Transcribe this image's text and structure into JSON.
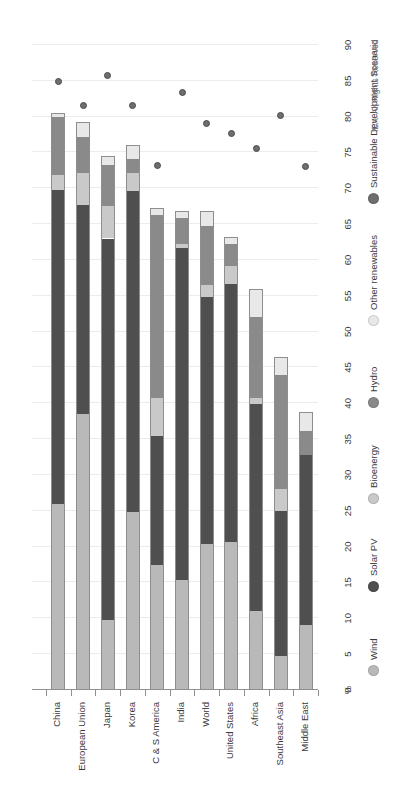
{
  "chart_data": {
    "type": "bar",
    "title": "",
    "subtitle": "",
    "xlabel": "",
    "ylabel": "%",
    "ylim": [
      0,
      90
    ],
    "ytick_step": 5,
    "yticks": [
      "0",
      "5",
      "10",
      "15",
      "20",
      "25",
      "30",
      "35",
      "40",
      "45",
      "50",
      "55",
      "60",
      "65",
      "70",
      "75",
      "80",
      "85",
      "90"
    ],
    "grid": true,
    "orientation": "vertical-bars-rotated-90",
    "stacked": true,
    "legend_position": "right",
    "categories": [
      "China",
      "European Union",
      "Japan",
      "Korea",
      "C & S America",
      "India",
      "World",
      "United States",
      "Africa",
      "Southeast Asia",
      "Middle East"
    ],
    "series": [
      {
        "name": "Wind",
        "color": "#b9b9b9",
        "values": [
          26.0,
          38.5,
          9.8,
          24.8,
          17.5,
          15.3,
          20.4,
          20.6,
          11.0,
          4.8,
          9.0
        ]
      },
      {
        "name": "Solar PV",
        "color": "#4f4f4f",
        "values": [
          43.8,
          29.2,
          53.2,
          44.8,
          18.0,
          46.4,
          34.5,
          36.0,
          28.9,
          20.2,
          23.8
        ]
      },
      {
        "name": "Bioenergy",
        "color": "#c9c9c9",
        "values": [
          2.1,
          4.4,
          4.6,
          2.6,
          5.2,
          0.6,
          1.6,
          2.6,
          0.8,
          3.0,
          0.0
        ]
      },
      {
        "name": "Hydro",
        "color": "#8a8a8a",
        "values": [
          8.1,
          5.1,
          5.6,
          1.9,
          25.6,
          3.5,
          8.2,
          3.0,
          11.3,
          15.9,
          3.4
        ]
      },
      {
        "name": "Other renewables",
        "color": "#e8e8e8",
        "values": [
          0.5,
          2.0,
          1.3,
          2.0,
          1.0,
          1.1,
          2.1,
          1.0,
          4.0,
          2.5,
          2.6
        ]
      }
    ],
    "scenario_series": {
      "name": "Sustainable Development Scenario",
      "color": "#6e6e6e",
      "marker": "circle",
      "values": [
        84.9,
        81.6,
        85.7,
        81.6,
        73.2,
        83.4,
        79.0,
        77.6,
        75.6,
        80.2,
        73.0
      ]
    }
  },
  "legend": {
    "items": [
      {
        "label": "Wind",
        "color": "#b9b9b9",
        "icon": "circle-marker-icon"
      },
      {
        "label": "Solar PV",
        "color": "#4f4f4f",
        "icon": "circle-marker-icon"
      },
      {
        "label": "Bioenergy",
        "color": "#c9c9c9",
        "icon": "circle-marker-icon"
      },
      {
        "label": "Hydro",
        "color": "#8a8a8a",
        "icon": "circle-marker-icon"
      },
      {
        "label": "Other renewables",
        "color": "#e8e8e8",
        "icon": "circle-marker-icon"
      },
      {
        "label": "Sustainable Development Scenario",
        "color": "#6e6e6e",
        "icon": "circle-marker-icon"
      }
    ]
  },
  "footer": {
    "credit": "IEA. All Rights Reserved"
  }
}
